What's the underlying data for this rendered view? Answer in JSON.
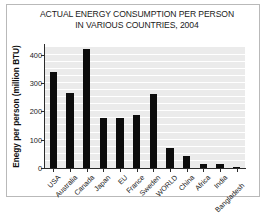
{
  "chart_data": {
    "type": "bar",
    "title": "ACTUAL ENERGY CONSUMPTION PER PERSON IN VARIOUS COUNTRIES, 2004",
    "title_lines": [
      "ACTUAL ENERGY CONSUMPTION PER PERSON",
      "IN VARIOUS COUNTRIES, 2004"
    ],
    "xlabel": "",
    "ylabel": "Enegy per person (million BTU)",
    "categories": [
      "USA",
      "Australia",
      "Canada",
      "Japan",
      "EU",
      "France",
      "Sweden",
      "WORLD",
      "China",
      "Africa",
      "India",
      "Bangladesh"
    ],
    "values": [
      340,
      265,
      420,
      175,
      178,
      187,
      260,
      70,
      43,
      14,
      14,
      5
    ],
    "ylim": [
      0,
      430
    ],
    "yticks": [
      0,
      100,
      200,
      300,
      400
    ],
    "ytick_labels": [
      "0",
      "100",
      "200",
      "300",
      "400"
    ],
    "grid": true,
    "grid_spacing": 25,
    "legend": "none",
    "bar_color": "#0d0d0d",
    "plot_background": "#ebebeb",
    "gridline_color": "#ffffff",
    "axis_color": "#2b2b2b",
    "frame_color": "#b9b9b9"
  }
}
